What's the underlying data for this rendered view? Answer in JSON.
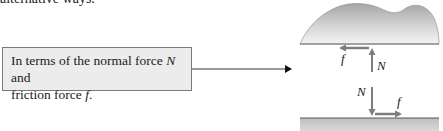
{
  "header": {
    "clipped_text": "alternative ways."
  },
  "callout": {
    "line1_prefix": "In terms of the normal force ",
    "line1_var": "N",
    "line1_suffix": " and",
    "line2_prefix": "friction force ",
    "line2_var": "f",
    "line2_suffix": "."
  },
  "diagram": {
    "upper_labels": {
      "friction": "f",
      "normal": "N"
    },
    "lower_labels": {
      "friction": "f",
      "normal": "N"
    },
    "colors": {
      "arrow": "#7d7d7d",
      "blob_top": "#a9a9a9",
      "blob_bottom": "#f2f2f2",
      "ground": "#c9c9c9",
      "ground_line": "#555555",
      "connector": "#333333"
    }
  }
}
